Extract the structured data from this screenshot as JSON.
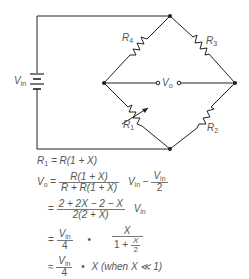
{
  "diagram": {
    "source_label": "V",
    "source_sub": "in",
    "output_label": "V",
    "output_sub": "o",
    "resistors": [
      {
        "id": "R1",
        "main": "R",
        "sub": "1",
        "variable": true
      },
      {
        "id": "R2",
        "main": "R",
        "sub": "2",
        "variable": false
      },
      {
        "id": "R3",
        "main": "R",
        "sub": "3",
        "variable": false
      },
      {
        "id": "R4",
        "main": "R",
        "sub": "4",
        "variable": false
      }
    ],
    "colors": {
      "line": "#222222",
      "text": "#555555"
    }
  },
  "equations": {
    "eq1": {
      "lhs": "R",
      "lhs_sub": "1",
      "rhs": " = R(1 + X)"
    },
    "eq2": {
      "lhs": "V",
      "lhs_sub": "o",
      "eq": " = ",
      "frac_num": "R(1 + X)",
      "frac_den": "R + R(1 + X)",
      "mid": "V",
      "mid_sub": "in",
      "minus": " − ",
      "frac2_num_main": "V",
      "frac2_num_sub": "in",
      "frac2_den": "2"
    },
    "eq3": {
      "eq": "= ",
      "frac_num": "2 + 2X − 2 − X",
      "frac_den": "2(2 + X)",
      "tail": "V",
      "tail_sub": "in"
    },
    "eq4": {
      "eq": "= ",
      "frac_num_main": "V",
      "frac_num_sub": "in",
      "frac_den": "4",
      "dot": "•",
      "frac2_num": "X",
      "frac2_den_pre": "1 + ",
      "frac2_den_num": "X",
      "frac2_den_den": "2"
    },
    "eq5": {
      "eq": "≈ ",
      "frac_num_main": "V",
      "frac_num_sub": "in",
      "frac_den": "4",
      "dot": "•",
      "tail": "X (when X ≪ 1)"
    }
  }
}
